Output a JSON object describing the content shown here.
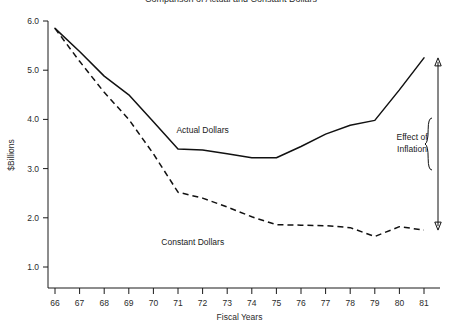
{
  "chart_data": {
    "type": "line",
    "title": "Comparison of Actual and Constant Dollars",
    "xlabel": "Fiscal Years",
    "ylabel": "$Billions",
    "categories": [
      "66",
      "67",
      "68",
      "69",
      "70",
      "71",
      "72",
      "73",
      "74",
      "75",
      "76",
      "77",
      "78",
      "79",
      "80",
      "81"
    ],
    "xlim": [
      66,
      81
    ],
    "ylim": [
      1.0,
      6.0
    ],
    "yticks": [
      "1.0",
      "2.0",
      "3.0",
      "4.0",
      "5.0",
      "6.0"
    ],
    "ytick_values": [
      1.0,
      2.0,
      3.0,
      4.0,
      5.0,
      6.0
    ],
    "grid": false,
    "legend": "inline-labels",
    "series": [
      {
        "name": "Actual Dollars",
        "style": "solid",
        "label_x": 72.0,
        "label_y": 3.72,
        "values": [
          5.85,
          5.38,
          4.88,
          4.5,
          3.95,
          3.4,
          3.38,
          3.3,
          3.22,
          3.22,
          3.45,
          3.7,
          3.88,
          3.98,
          4.6,
          5.25
        ]
      },
      {
        "name": "Constant Dollars",
        "style": "dashed",
        "label_x": 71.6,
        "label_y": 1.45,
        "values": [
          5.85,
          5.18,
          4.55,
          4.0,
          3.3,
          2.52,
          2.4,
          2.22,
          2.02,
          1.86,
          1.85,
          1.84,
          1.8,
          1.62,
          1.82,
          1.75
        ]
      }
    ],
    "annotations": [
      {
        "name": "effect-of-inflation",
        "text_line1": "Effect of",
        "text_line2": "Inflation",
        "at_x": 81,
        "from_y": 1.75,
        "to_y": 5.25,
        "marker": "double-headed-arrow-with-brace"
      }
    ]
  }
}
